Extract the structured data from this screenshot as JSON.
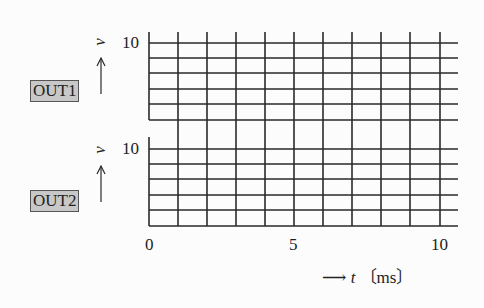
{
  "channels": [
    {
      "name": "OUT1",
      "y_label": "v",
      "y_tick_top": "10"
    },
    {
      "name": "OUT2",
      "y_label": "v",
      "y_tick_top": "10"
    }
  ],
  "x_axis": {
    "ticks": [
      "0",
      "5",
      "10"
    ],
    "label_var": "t",
    "label_unit": "〔ms〕",
    "arrow": "⟶"
  },
  "grid": {
    "x_divisions": 10,
    "y_divisions_per_panel": 5,
    "x_range": [
      0,
      10
    ],
    "y_range": [
      0,
      10
    ]
  },
  "colors": {
    "grid": "#2a2a2a",
    "label_box_fill": "#c8c8c8",
    "background": "#fcfcfc"
  }
}
